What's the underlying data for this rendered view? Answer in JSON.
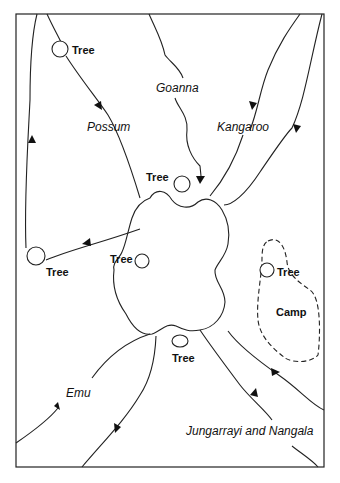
{
  "figure": {
    "type": "map-diagram",
    "labels": {
      "trees": [
        "Tree",
        "Tree",
        "Tree",
        "Tree",
        "Tree",
        "Tree"
      ],
      "goanna": "Goanna",
      "possum": "Possum",
      "kangaroo": "Kangaroo",
      "emu": "Emu",
      "camp": "Camp",
      "jungarrayi": "Jungarrayi and Nangala"
    },
    "caption_partial": ""
  },
  "colors": {
    "stroke": "#222222",
    "background": "#ffffff"
  }
}
